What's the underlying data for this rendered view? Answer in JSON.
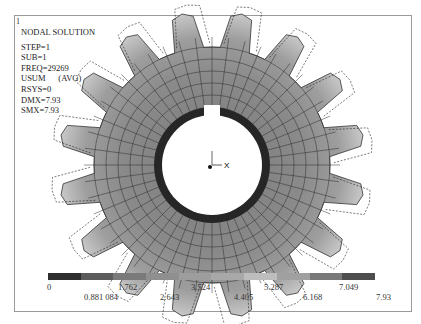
{
  "window": {
    "number": "1"
  },
  "info_panel": {
    "title": "NODAL SOLUTION",
    "lines": [
      "STEP=1",
      "SUB=1",
      "FREQ=29269",
      "USUM      (AVG)",
      "RSYS=0",
      "DMX=7.93",
      "SMX=7.93"
    ]
  },
  "triad": {
    "x_label": "X",
    "y_label": "Y"
  },
  "colorbar": {
    "colors": [
      "#2e2e2e",
      "#5c5c5c",
      "#7a7a7a",
      "#8f8f8f",
      "#9d9d9d",
      "#a8a8a8",
      "#bdbdbd",
      "#a0a0a0",
      "#787878",
      "#4e4e4e"
    ],
    "labels_top": [
      "0",
      "1.762",
      "3.524",
      "5.287",
      "7.049"
    ],
    "labels_bottom": [
      "0.881 084",
      "2.643",
      "4.405",
      "6.168",
      "7.93"
    ]
  },
  "model": {
    "type": "spur gear modal deformation plot",
    "teeth": 16,
    "outline_label": "MX"
  }
}
